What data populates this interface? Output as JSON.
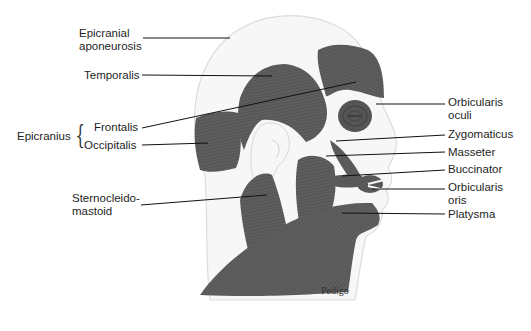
{
  "diagram": {
    "colors": {
      "muscle": "#5e5e5e",
      "muscle_dark": "#4a4a4a",
      "skin_outline": "#d8d8d8",
      "skin_fill": "#f6f6f6",
      "leader_line": "#111111",
      "label_text": "#1e1e1e",
      "background": "#ffffff"
    },
    "labels_left": [
      {
        "id": "epicranial-aponeurosis",
        "line1": "Epicranial",
        "line2": "aponeurosis"
      },
      {
        "id": "temporalis",
        "line1": "Temporalis"
      },
      {
        "id": "frontalis",
        "line1": "Frontalis"
      },
      {
        "id": "occipitalis",
        "line1": "Occipitalis"
      },
      {
        "id": "sternocleidomastoid",
        "line1": "Sternocleido-",
        "line2": "mastoid"
      }
    ],
    "group_label": {
      "id": "epicranius",
      "text": "Epicranius",
      "brace": "{"
    },
    "labels_right": [
      {
        "id": "orbicularis-oculi",
        "line1": "Orbicularis",
        "line2": "oculi"
      },
      {
        "id": "zygomaticus",
        "line1": "Zygomaticus"
      },
      {
        "id": "masseter",
        "line1": "Masseter"
      },
      {
        "id": "buccinator",
        "line1": "Buccinator"
      },
      {
        "id": "orbicularis-oris",
        "line1": "Orbicularis",
        "line2": "oris"
      },
      {
        "id": "platysma",
        "line1": "Platysma"
      }
    ],
    "signature": "Pedigo"
  }
}
